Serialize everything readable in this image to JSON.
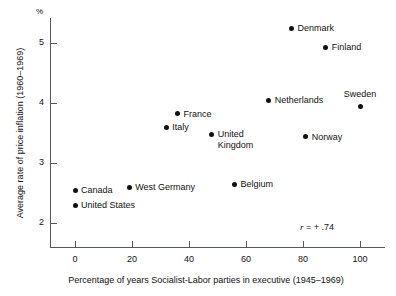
{
  "chart_data": {
    "type": "scatter",
    "title": "",
    "xlabel": "Percentage of years Socialist-Labor parties in executive (1945–1969)",
    "ylabel": "Average rate of price inflation (1960–1969)",
    "yunit": "%",
    "xlim": [
      -8,
      110
    ],
    "ylim": [
      1.62,
      5.42
    ],
    "xticks": [
      0,
      20,
      40,
      60,
      80,
      100
    ],
    "xticklabels": [
      "0",
      "20",
      "40",
      "60",
      "80",
      "100"
    ],
    "yticks": [
      2,
      3,
      4,
      5
    ],
    "yticklabels": [
      "2",
      "3",
      "4",
      "5"
    ],
    "grid": false,
    "legend": null,
    "annotations": [
      {
        "name": "correlation",
        "prefix": "r",
        "text": " =  + .74",
        "full_text": "r =  + .74",
        "x": 93,
        "y": 2.03
      }
    ],
    "marker_color": "#111111",
    "axis_color": "#555a5e",
    "points": [
      {
        "label": "Canada",
        "x": 0,
        "y": 2.55,
        "label_pos": "right"
      },
      {
        "label": "United States",
        "x": 0,
        "y": 2.3,
        "label_pos": "right"
      },
      {
        "label": "West Germany",
        "x": 19,
        "y": 2.6,
        "label_pos": "right"
      },
      {
        "label": "Italy",
        "x": 32,
        "y": 3.6,
        "label_pos": "right"
      },
      {
        "label": "France",
        "x": 36,
        "y": 3.82,
        "label_pos": "right"
      },
      {
        "label": "United\nKingdom",
        "x": 48,
        "y": 3.48,
        "label_pos": "right"
      },
      {
        "label": "Belgium",
        "x": 56,
        "y": 2.65,
        "label_pos": "right"
      },
      {
        "label": "Netherlands",
        "x": 68,
        "y": 4.05,
        "label_pos": "right"
      },
      {
        "label": "Denmark",
        "x": 76,
        "y": 5.25,
        "label_pos": "right"
      },
      {
        "label": "Norway",
        "x": 81,
        "y": 3.44,
        "label_pos": "right"
      },
      {
        "label": "Finland",
        "x": 88,
        "y": 4.93,
        "label_pos": "right"
      },
      {
        "label": "Sweden",
        "x": 100,
        "y": 3.95,
        "label_pos": "above"
      }
    ]
  }
}
